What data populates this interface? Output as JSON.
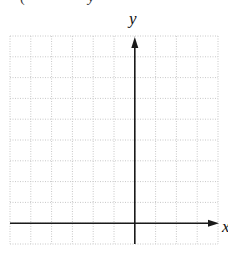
{
  "header_fragments": [
    "(",
    "y",
    ")"
  ],
  "chart_data": {
    "type": "coordinate-grid",
    "title": "",
    "xlabel": "x",
    "ylabel": "y",
    "grid": {
      "columns": 10,
      "rows": 10,
      "cell_px": 20.8,
      "line_style": "dotted",
      "line_color": "#c8c8c8"
    },
    "origin_cell_offset": {
      "from_left": 6,
      "from_top": 9
    },
    "axes": {
      "color": "#1a1a1a",
      "x_arrow": "right",
      "y_arrow": "up"
    },
    "data": []
  },
  "labels": {
    "x": "x",
    "y": "y"
  }
}
